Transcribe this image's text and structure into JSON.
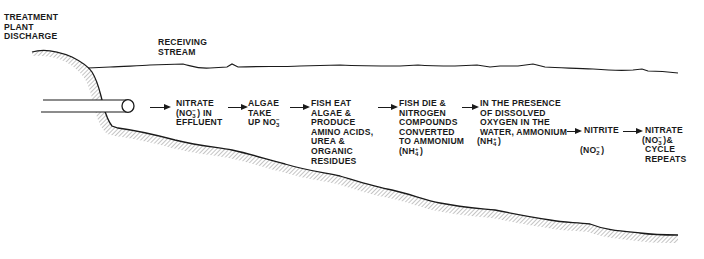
{
  "diagram": {
    "title_labels": {
      "treatment_plant": [
        "TREATMENT",
        "PLANT",
        "DISCHARGE"
      ],
      "receiving_stream": [
        "RECEIVING",
        "STREAM"
      ]
    },
    "steps": [
      {
        "id": "nitrate-effluent",
        "lines": [
          "NITRATE",
          "(NO3-) IN",
          "EFFLUENT"
        ],
        "chem": {
          "base": "(NO",
          "sub": "3",
          "sup": "−",
          "after": ") IN"
        }
      },
      {
        "id": "algae-uptake",
        "lines": [
          "ALGAE",
          "TAKE",
          "UP NO3-"
        ],
        "chem": {
          "base": "UP NO",
          "sub": "3",
          "sup": "−",
          "after": ""
        }
      },
      {
        "id": "fish-eat",
        "lines": [
          "FISH EAT",
          "ALGAE &",
          "PRODUCE",
          "AMINO ACIDS,",
          "UREA &",
          "ORGANIC",
          "RESIDUES"
        ]
      },
      {
        "id": "fish-die",
        "lines": [
          "FISH DIE &",
          "NITROGEN",
          "COMPOUNDS",
          "CONVERTED",
          "TO AMMONIUM",
          "(NH4+)"
        ],
        "chem": {
          "base": "(NH",
          "sub": "4",
          "sup": "+",
          "after": ")"
        }
      },
      {
        "id": "dissolved-oxygen",
        "lines": [
          "IN THE PRESENCE",
          "OF DISSOLVED",
          "OXYGEN IN THE",
          "WATER, AMMONIUM",
          "(NH4+)"
        ],
        "chem": {
          "base": "(NH",
          "sub": "4",
          "sup": "+",
          "after": ")"
        }
      },
      {
        "id": "nitrite",
        "lines": [
          "NITRITE",
          "(NO2-)"
        ],
        "chem": {
          "base": "(NO",
          "sub": "2",
          "sup": "−",
          "after": ")"
        }
      },
      {
        "id": "nitrate-repeat",
        "lines": [
          "NITRATE",
          "(NO3-)&",
          "CYCLE",
          "REPEATS"
        ],
        "chem": {
          "base": "(NO",
          "sub": "3",
          "sup": "−",
          "after": ")&"
        }
      }
    ],
    "colors": {
      "ink": "#1a1a1a",
      "hatch": "#8a8a8a",
      "background": "#ffffff"
    }
  }
}
